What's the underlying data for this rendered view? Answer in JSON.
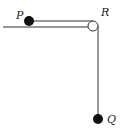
{
  "diagram": {
    "type": "pulley-system",
    "colors": {
      "line": "#333333",
      "ball": "#111111",
      "pulley_fill": "#ffffff",
      "background": "#ffffff"
    },
    "labels": {
      "P": "P",
      "R": "R",
      "Q": "Q"
    },
    "elements": {
      "table_edge": {
        "x1": 3,
        "y1": 27,
        "x2": 98,
        "y2": 27
      },
      "ball_P": {
        "cx": 29,
        "cy": 21,
        "r": 5
      },
      "string_horizontal": {
        "x1": 29,
        "y1": 21,
        "x2": 93,
        "y2": 21
      },
      "pulley_R": {
        "cx": 93,
        "cy": 26,
        "r": 5
      },
      "string_vertical": {
        "x1": 98,
        "y1": 26,
        "x2": 98,
        "y2": 116
      },
      "ball_Q": {
        "cx": 98,
        "cy": 119,
        "r": 5
      }
    }
  }
}
